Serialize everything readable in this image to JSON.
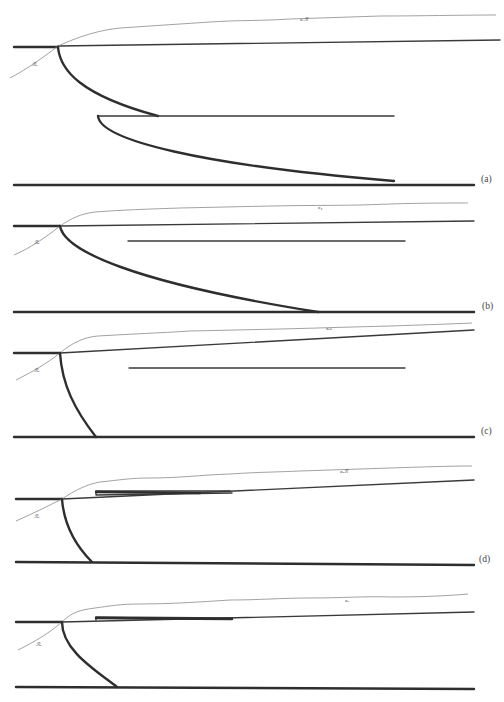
{
  "figure": {
    "panels": [
      {
        "id": "a",
        "label": "(a)",
        "inline_mark_top": "ᴙₓℛ",
        "inline_mark_left": "ℛᵤ"
      },
      {
        "id": "b",
        "label": "(b)",
        "inline_mark_top": "ᴙ₂",
        "inline_mark_left": "ℛᵤ"
      },
      {
        "id": "c",
        "label": "(c)",
        "inline_mark_top": "ᴙᵤₙ",
        "inline_mark_left": "ℛᵤ"
      },
      {
        "id": "d",
        "label": "(d)",
        "inline_mark_top": "ᴙᵤℛ",
        "inline_mark_left": "ℛᵤ"
      },
      {
        "id": "e",
        "label": "",
        "inline_mark_top": "ᴙᵤ",
        "inline_mark_left": "ℛᵤ"
      }
    ],
    "colors": {
      "line": "#2e2e2e",
      "thin_line": "#8a8a8a",
      "background": "#ffffff"
    }
  }
}
